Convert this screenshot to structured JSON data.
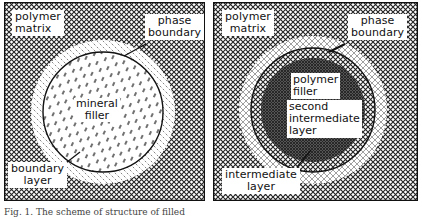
{
  "figure": {
    "left_panel": {
      "labels": {
        "polymer_matrix": [
          "polymer",
          "matrix"
        ],
        "phase_boundary": [
          "phase",
          "boundary"
        ],
        "mineral_filler": [
          "mineral",
          "filler"
        ],
        "boundary_layer": [
          "boundary",
          "layer"
        ]
      }
    },
    "right_panel": {
      "labels": {
        "polymer_matrix": [
          "polymer",
          "matrix"
        ],
        "phase_boundary": [
          "phase",
          "boundary"
        ],
        "polymer_filler": [
          "polymer",
          "filler"
        ],
        "second_intermediate_layer": [
          "second",
          "intermediate",
          "layer"
        ],
        "intermediate_layer": [
          "intermediate",
          "layer"
        ]
      }
    },
    "caption": "Fig. 1. The scheme of structure of filled"
  },
  "colors": {
    "ink": "#111111",
    "paper": "#ffffff",
    "dense_fill": "#555555"
  }
}
